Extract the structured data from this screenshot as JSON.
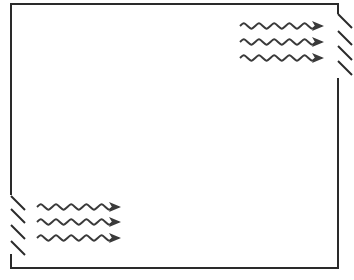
{
  "diagram": {
    "type": "cross-ventilation",
    "stroke_color": "#2a2a2a",
    "arrow_color": "#3a3a3a",
    "background": "#ffffff",
    "room": {
      "left": 11,
      "top": 4,
      "right": 338,
      "bottom": 268
    },
    "openings": [
      {
        "name": "upper-right-louver",
        "wall": "right",
        "wall_gap": [
          14,
          78
        ],
        "louvers": [
          {
            "x1": 338,
            "y1": 14,
            "x2": 352,
            "y2": 28
          },
          {
            "x1": 338,
            "y1": 31,
            "x2": 352,
            "y2": 45
          },
          {
            "x1": 338,
            "y1": 46,
            "x2": 352,
            "y2": 60
          },
          {
            "x1": 338,
            "y1": 61,
            "x2": 352,
            "y2": 75
          }
        ]
      },
      {
        "name": "lower-left-louver",
        "wall": "left",
        "wall_gap": [
          195,
          254
        ],
        "louvers": [
          {
            "x1": 11,
            "y1": 196,
            "x2": 25,
            "y2": 210
          },
          {
            "x1": 11,
            "y1": 209,
            "x2": 25,
            "y2": 223
          },
          {
            "x1": 11,
            "y1": 225,
            "x2": 25,
            "y2": 239
          },
          {
            "x1": 11,
            "y1": 241,
            "x2": 25,
            "y2": 255
          }
        ]
      }
    ],
    "airflow_groups": [
      {
        "name": "upper-airflow",
        "x_start": 240,
        "x_end": 324,
        "rows_y": [
          26,
          42,
          58
        ]
      },
      {
        "name": "lower-airflow",
        "x_start": 37,
        "x_end": 121,
        "rows_y": [
          207,
          222,
          238
        ]
      }
    ]
  }
}
